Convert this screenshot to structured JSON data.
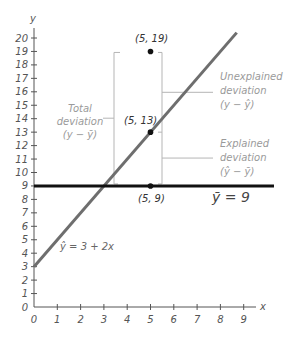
{
  "chart_data": {
    "type": "line",
    "title": "",
    "xlabel": "x",
    "ylabel": "y",
    "xlim": [
      0,
      9
    ],
    "ylim": [
      0,
      20
    ],
    "grid": false,
    "x_ticks": [
      "0",
      "1",
      "2",
      "3",
      "4",
      "5",
      "6",
      "7",
      "8",
      "9"
    ],
    "y_ticks": [
      "0",
      "1",
      "2",
      "3",
      "4",
      "5",
      "6",
      "7",
      "8",
      "9",
      "10",
      "11",
      "12",
      "13",
      "14",
      "15",
      "16",
      "17",
      "18",
      "19",
      "20"
    ],
    "series": [
      {
        "name": "Regression line",
        "equation": "ŷ = 3 + 2x",
        "intercept": 3,
        "slope": 2,
        "x": [
          0,
          8.7
        ],
        "y": [
          3,
          20.4
        ],
        "color": "#6e6e6e"
      },
      {
        "name": "Mean line",
        "equation": "ȳ = 9",
        "y_value": 9,
        "x": [
          0,
          10.3
        ],
        "color": "#111111"
      }
    ],
    "points": [
      {
        "x": 5,
        "y": 19,
        "label": "(5, 19)"
      },
      {
        "x": 5,
        "y": 13,
        "label": "(5, 13)"
      },
      {
        "x": 5,
        "y": 9,
        "label": "(5, 9)"
      }
    ],
    "annotations": [
      {
        "text": [
          "Total",
          "deviation",
          "(y − ȳ)"
        ],
        "spans": [
          9,
          19
        ],
        "side": "left"
      },
      {
        "text": [
          "Unexplained",
          "deviation",
          "(y − ŷ)"
        ],
        "spans": [
          13,
          19
        ],
        "side": "right"
      },
      {
        "text": [
          "Explained",
          "deviation",
          "(ŷ − ȳ)"
        ],
        "spans": [
          9,
          13
        ],
        "side": "right"
      }
    ]
  },
  "labels": {
    "x_axis": "x",
    "y_axis": "y",
    "regression_eq": "ŷ = 3 + 2x",
    "mean_eq": "ȳ = 9",
    "p19": "(5, 19)",
    "p13": "(5, 13)",
    "p9": "(5, 9)",
    "total": [
      "Total",
      "deviation",
      "(y − ȳ)"
    ],
    "unexplained": [
      "Unexplained",
      "deviation",
      "(y − ŷ)"
    ],
    "explained": [
      "Explained",
      "deviation",
      "(ŷ − ȳ)"
    ]
  },
  "colors": {
    "axis": "#555555",
    "regression": "#6e6e6e",
    "mean": "#111111",
    "bracket": "#b5b5b5",
    "point": "#111111"
  }
}
